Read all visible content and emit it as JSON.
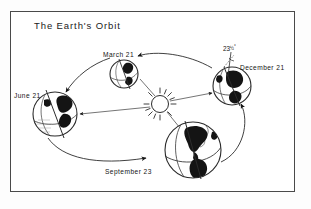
{
  "figure": {
    "title": "The Earth's Orbit",
    "border_color": "#4a4a4a",
    "ink_color": "#141414",
    "background_color": "#ffffff"
  },
  "sun": {
    "name": "Sun",
    "rays": 12
  },
  "tilt_annotation": {
    "value": "23",
    "fraction": "1/2",
    "degree_symbol": "°",
    "full_text": "23 1/2°",
    "attached_to": "December 21"
  },
  "positions": [
    {
      "id": "march",
      "label": "March 21",
      "season_event": "Vernal Equinox",
      "cx": 124,
      "cy": 74,
      "r": 14,
      "axis_tilt_deg": 23.5
    },
    {
      "id": "december",
      "label": "December 21",
      "season_event": "Winter Solstice",
      "cx": 232,
      "cy": 86,
      "r": 19,
      "axis_tilt_deg": 23.5
    },
    {
      "id": "june",
      "label": "June 21",
      "season_event": "Summer Solstice",
      "cx": 55,
      "cy": 114,
      "r": 22,
      "axis_tilt_deg": 23.5
    },
    {
      "id": "september",
      "label": "September 23",
      "season_event": "Autumnal Equinox",
      "cx": 193,
      "cy": 150,
      "r": 28,
      "axis_tilt_deg": 23.5
    }
  ],
  "orbit": {
    "direction": "counterclockwise",
    "arrow_count": 4
  }
}
